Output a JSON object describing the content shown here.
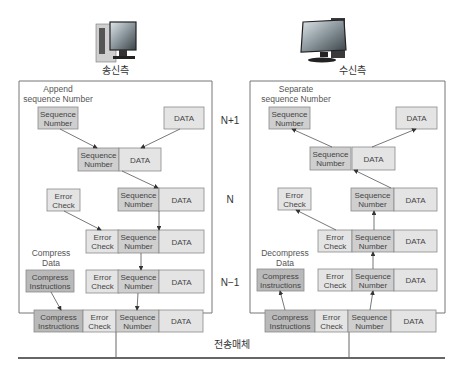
{
  "sender": {
    "title": "송신측",
    "caption_append": [
      "Append",
      "sequence Number"
    ],
    "caption_compress": [
      "Compress",
      "Data"
    ]
  },
  "receiver": {
    "title": "수신측",
    "caption_separate": [
      "Separate",
      "sequence Number"
    ],
    "caption_decompress": [
      "Decompress",
      "Data"
    ]
  },
  "levels": [
    "N+1",
    "N",
    "N−1"
  ],
  "medium_label": "전송매체",
  "labels": {
    "seq": [
      "Sequence",
      "Number"
    ],
    "data": [
      "DATA"
    ],
    "err": [
      "Error",
      "Check"
    ],
    "comp": [
      "Compress",
      "Instructions"
    ]
  },
  "colors": {
    "box_light": "#e4e4e4",
    "box_mid": "#cfcfcf",
    "box_dark": "#b9b9b9",
    "border": "#8a8a8a",
    "line": "#555555"
  }
}
